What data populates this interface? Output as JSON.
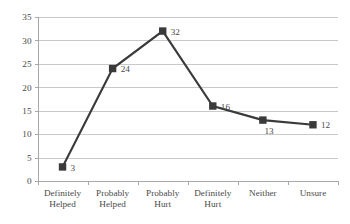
{
  "chart_data": {
    "type": "line",
    "title": "",
    "subtitle": "",
    "xlabel": "",
    "ylabel": "",
    "categories": [
      "Definitely Helped",
      "Probably Helped",
      "Probably Hurt",
      "Definitely Hurt",
      "Neither",
      "Unsure"
    ],
    "category_lines": [
      [
        "Definitely",
        "Helped"
      ],
      [
        "Probably",
        "Helped"
      ],
      [
        "Probably",
        "Hurt"
      ],
      [
        "Definitely",
        "Hurt"
      ],
      [
        "Neither",
        ""
      ],
      [
        "Unsure",
        ""
      ]
    ],
    "values": [
      3,
      24,
      32,
      16,
      13,
      12
    ],
    "point_labels": [
      "3",
      "24",
      "32",
      "16",
      "13",
      "12"
    ],
    "ylim": [
      0,
      35
    ],
    "ytick_values": [
      0,
      5,
      10,
      15,
      20,
      25,
      30,
      35
    ],
    "ytick_labels": [
      "0",
      "5",
      "10",
      "15",
      "20",
      "25",
      "30",
      "35"
    ],
    "grid": true,
    "grid_axis": "y",
    "legend": false,
    "legend_position": "none",
    "marker": "square",
    "colors": {
      "series": "#3a3a3a",
      "marker": "#3a3a3a",
      "gridline": "#c9c9c9",
      "axis": "#a8a8a8",
      "text": "#4a4a4a",
      "background": "#ffffff"
    }
  }
}
